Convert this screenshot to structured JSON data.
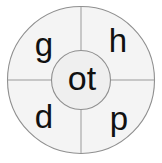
{
  "wheel": {
    "type": "phonics-word-wheel",
    "center_text": "ot",
    "segments": [
      {
        "position": "top-left",
        "letter": "g"
      },
      {
        "position": "top-right",
        "letter": "h"
      },
      {
        "position": "bottom-left",
        "letter": "d"
      },
      {
        "position": "bottom-right",
        "letter": "p"
      }
    ],
    "words": [
      "got",
      "hot",
      "dot",
      "pot"
    ],
    "colors": {
      "background": "#ffffff",
      "outer_fill": "#f4f4f4",
      "inner_fill": "#efefef",
      "stroke": "#8f8f8f",
      "divider": "#9a9a9a",
      "text": "#111111"
    },
    "geometry": {
      "canvas_width": 162,
      "canvas_height": 163,
      "center_x": 81,
      "center_y": 80,
      "outer_radius": 74,
      "inner_radius": 30
    }
  }
}
